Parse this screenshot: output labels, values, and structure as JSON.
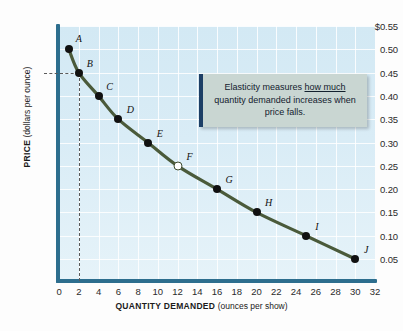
{
  "chart_data": {
    "type": "line",
    "title": "",
    "xlabel_bold": "QUANTITY DEMANDED",
    "xlabel_unit": "(ounces per show)",
    "ylabel_bold": "PRICE",
    "ylabel_unit": "(dollars per ounce)",
    "xlim": [
      0,
      32
    ],
    "ylim": [
      0,
      0.55
    ],
    "grid": true,
    "legend": "none",
    "xticks": [
      "0",
      "2",
      "4",
      "6",
      "8",
      "10",
      "12",
      "14",
      "16",
      "18",
      "20",
      "22",
      "24",
      "26",
      "28",
      "30",
      "32"
    ],
    "xtick_values": [
      0,
      2,
      4,
      6,
      8,
      10,
      12,
      14,
      16,
      18,
      20,
      22,
      24,
      26,
      28,
      30,
      32
    ],
    "yticks": [
      "$0.55",
      "0.50",
      "0.45",
      "0.40",
      "0.35",
      "0.30",
      "0.25",
      "0.20",
      "0.15",
      "0.10",
      "0.05"
    ],
    "ytick_values": [
      0.55,
      0.5,
      0.45,
      0.4,
      0.35,
      0.3,
      0.25,
      0.2,
      0.15,
      0.1,
      0.05
    ],
    "series": [
      {
        "name": "Demand curve",
        "color": "#4a5a3a",
        "points": [
          {
            "label": "A",
            "x": 1,
            "y": 0.5,
            "marker": "filled",
            "label_dx": 10,
            "label_dy": -11
          },
          {
            "label": "B",
            "x": 2,
            "y": 0.45,
            "marker": "filled",
            "label_dx": 11,
            "label_dy": -10
          },
          {
            "label": "C",
            "x": 4,
            "y": 0.4,
            "marker": "filled",
            "label_dx": 11,
            "label_dy": -10
          },
          {
            "label": "D",
            "x": 6,
            "y": 0.35,
            "marker": "filled",
            "label_dx": 12,
            "label_dy": -10
          },
          {
            "label": "E",
            "x": 9,
            "y": 0.3,
            "marker": "filled",
            "label_dx": 12,
            "label_dy": -10
          },
          {
            "label": "F",
            "x": 12,
            "y": 0.25,
            "marker": "hollow",
            "label_dx": 12,
            "label_dy": -10
          },
          {
            "label": "G",
            "x": 16,
            "y": 0.2,
            "marker": "filled",
            "label_dx": 12,
            "label_dy": -10
          },
          {
            "label": "H",
            "x": 20,
            "y": 0.15,
            "marker": "filled",
            "label_dx": 12,
            "label_dy": -10
          },
          {
            "label": "I",
            "x": 25,
            "y": 0.1,
            "marker": "filled",
            "label_dx": 11,
            "label_dy": -10
          },
          {
            "label": "J",
            "x": 30,
            "y": 0.05,
            "marker": "filled",
            "label_dx": 11,
            "label_dy": -10
          }
        ]
      }
    ],
    "guide_lines": [
      {
        "type": "vertical",
        "x": 2,
        "from_y": 0.0,
        "to_y": 0.45
      },
      {
        "type": "horizontal",
        "y": 0.45,
        "from_x": 0,
        "to_x": 2
      }
    ],
    "annotations": [
      {
        "id": "elasticity-callout",
        "text_before": "Elasticity measures ",
        "text_underlined": "how much",
        "text_after": " quantity demanded increases when price falls."
      }
    ],
    "colors": {
      "plot_background": "#d6ebf5",
      "gridline": "#ffffff",
      "axis": "#2d6e8e",
      "curve": "#4a5a3a",
      "marker": "#111111",
      "callout_fill": "#c9d6d2",
      "callout_border": "#1d3f66"
    }
  }
}
